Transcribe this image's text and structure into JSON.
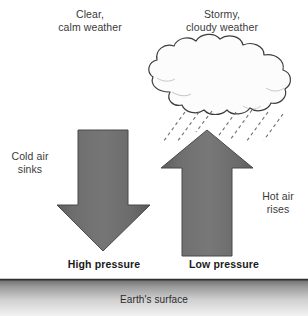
{
  "diagram": {
    "background_color": "#ffffff",
    "labels": {
      "clear_calm": "Clear,\ncalm weather",
      "stormy_cloudy": "Stormy,\ncloudy weather",
      "cold_air_sinks": "Cold air\nsinks",
      "hot_air_rises": "Hot air\nrises",
      "high_pressure": "High pressure",
      "low_pressure": "Low pressure",
      "earths_surface": "Earth's surface"
    },
    "elements": {
      "down_arrow": {
        "name": "cold-air-down-arrow",
        "direction": "down",
        "fill_color": "#6d6d6d",
        "stroke_color": "#4a4a4a"
      },
      "up_arrow": {
        "name": "hot-air-up-arrow",
        "direction": "up",
        "fill_color": "#6d6d6d",
        "stroke_color": "#4a4a4a"
      },
      "cloud": {
        "name": "storm-cloud",
        "fill_color": "#fcfcfc",
        "stroke_color": "#3d3d3d"
      },
      "rain": {
        "name": "rain-streaks",
        "stroke_color": "#6f6f6f",
        "style": "dashed",
        "count": 7
      },
      "ground": {
        "name": "earth-surface-band",
        "top_line_color": "#2e2e2e",
        "gradient_from": "#6f6f6f",
        "gradient_to": "#efefef"
      }
    }
  }
}
